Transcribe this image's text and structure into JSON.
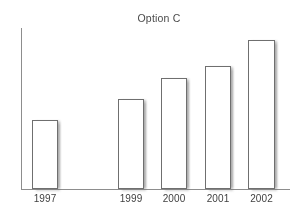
{
  "chart_data": {
    "type": "bar",
    "title": "Option C",
    "xlabel": "",
    "ylabel": "",
    "categories": [
      "1997",
      "1999",
      "2000",
      "2001",
      "2002"
    ],
    "values": [
      69,
      90,
      111,
      123,
      149
    ],
    "ylim": [
      0,
      161
    ],
    "grid": false,
    "legend": null,
    "bars": [
      {
        "category": "1997",
        "value": 69,
        "left_px": 32,
        "width_px": 26,
        "top_px": 120
      },
      {
        "category": "1999",
        "value": 90,
        "left_px": 118,
        "width_px": 26,
        "top_px": 99
      },
      {
        "category": "2000",
        "value": 111,
        "left_px": 161,
        "width_px": 26,
        "top_px": 78
      },
      {
        "category": "2001",
        "value": 123,
        "left_px": 205,
        "width_px": 26,
        "top_px": 66
      },
      {
        "category": "2002",
        "value": 149,
        "left_px": 248,
        "width_px": 27,
        "top_px": 40
      }
    ]
  },
  "colors": {
    "background": "#ffffff",
    "axis": "#8d8d8d",
    "bar_fill": "#ffffff",
    "bar_outline": "#6f6f6f",
    "bar_shadow": "#9a9a9a",
    "title_text": "#4a4a4a",
    "label_text": "#3f3f3f"
  }
}
